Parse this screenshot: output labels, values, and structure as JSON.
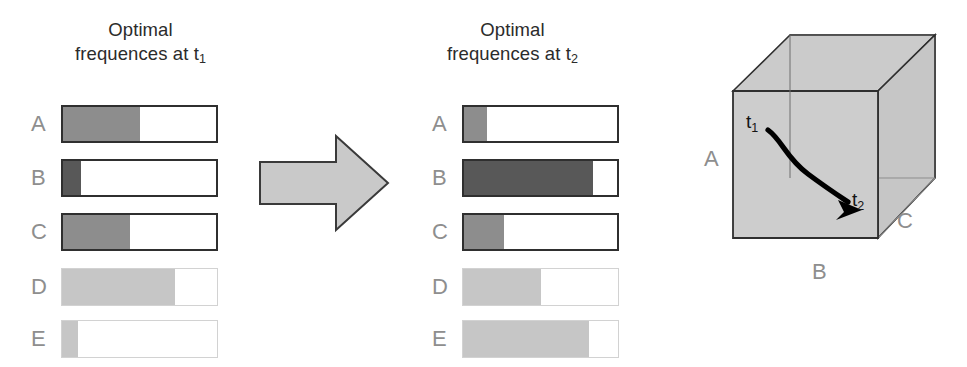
{
  "figure": {
    "panels": [
      {
        "id": "t1",
        "title_line1": "Optimal",
        "title_line2": "frequences at t",
        "title_subscript": "1",
        "left": 61,
        "bar_width": 157,
        "rows": [
          {
            "label": "A",
            "fill_percent": 50,
            "top": 105,
            "fill_tone": "mid",
            "edge": "dark"
          },
          {
            "label": "B",
            "fill_percent": 12,
            "top": 159,
            "fill_tone": "dark",
            "edge": "dark"
          },
          {
            "label": "C",
            "fill_percent": 44,
            "top": 213,
            "fill_tone": "mid",
            "edge": "dark"
          },
          {
            "label": "D",
            "fill_percent": 73,
            "top": 268,
            "fill_tone": "light",
            "edge": "light"
          },
          {
            "label": "E",
            "fill_percent": 10,
            "top": 320,
            "fill_tone": "light",
            "edge": "light"
          }
        ]
      },
      {
        "id": "t2",
        "title_line1": "Optimal",
        "title_line2": "frequences at t",
        "title_subscript": "2",
        "left": 462,
        "bar_width": 157,
        "rows": [
          {
            "label": "A",
            "fill_percent": 15,
            "top": 105,
            "fill_tone": "mid",
            "edge": "dark"
          },
          {
            "label": "B",
            "fill_percent": 84,
            "top": 159,
            "fill_tone": "dark",
            "edge": "dark"
          },
          {
            "label": "C",
            "fill_percent": 26,
            "top": 213,
            "fill_tone": "mid",
            "edge": "dark"
          },
          {
            "label": "D",
            "fill_percent": 50,
            "top": 268,
            "fill_tone": "light",
            "edge": "light"
          },
          {
            "label": "E",
            "fill_percent": 81,
            "top": 320,
            "fill_tone": "light",
            "edge": "light"
          }
        ]
      }
    ],
    "arrow": {
      "name": "transition-arrow",
      "direction": "right"
    },
    "cube": {
      "axis_a": "A",
      "axis_b": "B",
      "axis_c": "C",
      "t1": "t",
      "t1_subscript": "1",
      "t2": "t",
      "t2_subscript": "2"
    }
  },
  "colors": {
    "fill_mid": "#8d8d8d",
    "fill_dark": "#585858",
    "fill_light": "#c6c6c6",
    "edge_dark": "#2f2f2f",
    "edge_light": "#d2d2d2",
    "label_gray": "#8e8e8e",
    "cube_face": "#cfcfcf",
    "arrow_fill": "#c9c9c9"
  }
}
